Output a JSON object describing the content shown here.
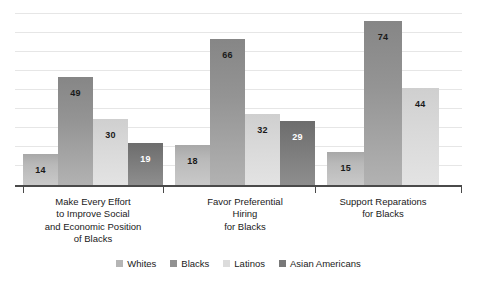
{
  "chart_data": {
    "type": "bar",
    "title": "",
    "subtitle": "",
    "xlabel": "",
    "ylabel": "",
    "ylim": [
      0,
      80
    ],
    "grid": true,
    "gridline_count": 9,
    "legend_position": "bottom",
    "categories": [
      "Make Every Effort to Improve Social and Economic Position of Blacks",
      "Favor Preferential Hiring for Blacks",
      "Support Reparations for Blacks"
    ],
    "category_lines": [
      [
        "Make Every Effort",
        "to Improve Social",
        "and Economic Position",
        "of Blacks"
      ],
      [
        "Favor Preferential",
        "Hiring",
        "for Blacks"
      ],
      [
        "Support Reparations",
        "for Blacks"
      ]
    ],
    "series": [
      {
        "name": "Whites",
        "color": "#b5b5b5",
        "label_color": "#1a1a1a",
        "values": [
          14,
          18,
          15
        ]
      },
      {
        "name": "Blacks",
        "color": "#919191",
        "label_color": "#1a1a1a",
        "values": [
          49,
          66,
          74
        ]
      },
      {
        "name": "Latinos",
        "color": "#dcdcdc",
        "label_color": "#1a1a1a",
        "values": [
          30,
          32,
          44
        ]
      },
      {
        "name": "Asian Americans",
        "color": "#787878",
        "label_color": "#ffffff",
        "values": [
          19,
          29,
          null
        ]
      }
    ],
    "value_labels": {
      "group1": [
        "14",
        "49",
        "30",
        "19"
      ],
      "group2": [
        "18",
        "66",
        "32",
        "29"
      ],
      "group3": [
        "15",
        "74",
        "44"
      ]
    }
  },
  "legend": {
    "items": [
      {
        "label": "Whites"
      },
      {
        "label": "Blacks"
      },
      {
        "label": "Latinos"
      },
      {
        "label": "Asian Americans"
      }
    ]
  }
}
